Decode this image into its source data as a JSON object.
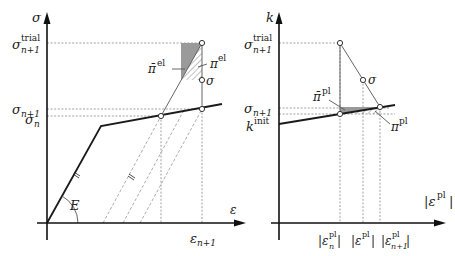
{
  "left_plot": {
    "y_axis_label": "σ",
    "x_axis_label": "ε",
    "y_ticks": {
      "trial": {
        "base": "σ",
        "sup": "trial",
        "sub": "n+1"
      },
      "n_plus_1": {
        "base": "σ",
        "sub": "n+1"
      },
      "n": {
        "base": "σ",
        "sub": "n"
      }
    },
    "x_tick": {
      "base": "ε",
      "sub": "n+1"
    },
    "modulus_label": "E",
    "pi_bar_label": {
      "base": "π̄",
      "sup": "el"
    },
    "pi_label": {
      "base": "π",
      "sup": "el"
    },
    "sigma_point_label": "σ"
  },
  "right_plot": {
    "y_axis_label": "k",
    "x_axis_label": {
      "base": "|ε",
      "sup": "pl",
      "close": "|"
    },
    "y_ticks": {
      "trial": {
        "base": "σ",
        "sup": "trial",
        "sub": "n+1"
      },
      "n_plus_1": {
        "base": "σ",
        "sub": "n+1"
      },
      "init": {
        "base": "k",
        "sup": "init"
      }
    },
    "x_ticks": [
      {
        "base": "|ε",
        "sup": "pl",
        "sub": "n",
        "close": "|"
      },
      {
        "base": "|ε",
        "sup": "pl",
        "sub": "",
        "close": "|"
      },
      {
        "base": "|ε",
        "sup": "pl",
        "sub": "n+1",
        "close": "|"
      }
    ],
    "pi_bar_label": {
      "base": "π̄",
      "sup": "pl"
    },
    "pi_label": {
      "base": "π",
      "sup": "pl"
    },
    "sigma_point_label": "σ"
  }
}
